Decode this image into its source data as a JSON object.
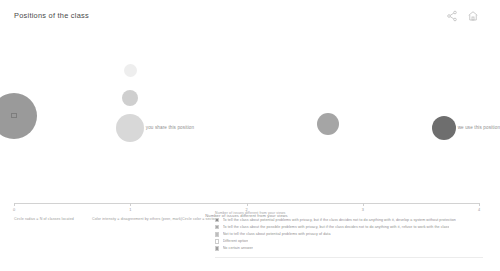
{
  "header": {
    "title": "Positions of the class",
    "icons": [
      {
        "name": "share-icon",
        "label": "Share"
      },
      {
        "name": "home-icon",
        "label": "Home"
      }
    ]
  },
  "chart_data": {
    "type": "scatter",
    "title": "Positions of the class",
    "xlabel": "Number of issues different from your views",
    "ylabel": "",
    "xlim": [
      0,
      4
    ],
    "ylim": [
      0,
      1
    ],
    "grid": false,
    "legend_position": "bottom-right",
    "tick_labels": [
      "0",
      "1",
      "2",
      "3",
      "4"
    ],
    "tick_values": [
      0,
      1,
      2,
      3,
      4
    ],
    "bubbles": [
      {
        "label": "",
        "x": 0,
        "y": 0.52,
        "size": 46,
        "color": "#9a9a9a",
        "centroid": true
      },
      {
        "label": "",
        "x": 1,
        "y": 0.78,
        "size": 13,
        "color": "#eeeeee",
        "centroid": false
      },
      {
        "label": "",
        "x": 1,
        "y": 0.62,
        "size": 16,
        "color": "#cfcfcf",
        "centroid": false
      },
      {
        "label": "you share this position",
        "x": 1,
        "y": 0.45,
        "size": 28,
        "color": "#d8d8d8",
        "centroid": false
      },
      {
        "label": "",
        "x": 2.7,
        "y": 0.47,
        "size": 22,
        "color": "#a5a5a5",
        "centroid": false
      },
      {
        "label": "we use this position",
        "x": 3.7,
        "y": 0.45,
        "size": 24,
        "color": "#6e6e6e",
        "centroid": false
      }
    ],
    "annotations": [
      "Circle radius = N of classes located",
      "Color intensity = disagreement by others (peer, mark)",
      "Circle color = sector"
    ],
    "legend": {
      "caption": "Number of issues different from your views",
      "items": [
        {
          "color": "#8d8d8d",
          "text": "To tell the class about potential problems with privacy, but if the class decides not to do anything with it, develop a system without protection"
        },
        {
          "color": "#a8a8a8",
          "text": "To tell the class about the possible problems with privacy, but if the class decides not to do anything with it, refuse to work with the class"
        },
        {
          "color": "#bdbdbd",
          "text": "Not to tell the class about potential problems with privacy of data"
        },
        {
          "color": "#ffffff",
          "text": "Different option"
        },
        {
          "color": "#9e9e9e",
          "text": "No certain answer"
        }
      ]
    }
  }
}
